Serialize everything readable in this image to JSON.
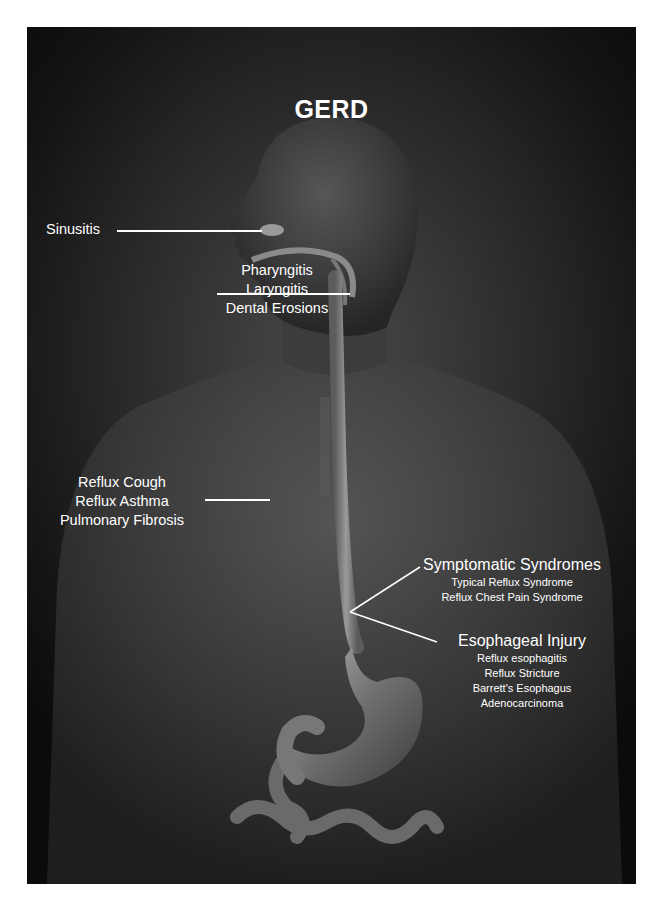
{
  "title": "GERD",
  "labels": {
    "sinusitis": {
      "text": "Sinusitis"
    },
    "throat": {
      "lines": [
        "Pharyngitis",
        "Laryngitis",
        "Dental Erosions"
      ]
    },
    "pulmonary": {
      "lines": [
        "Reflux Cough",
        "Reflux Asthma",
        "Pulmonary Fibrosis"
      ]
    },
    "symptomatic": {
      "heading": "Symptomatic Syndromes",
      "items": [
        "Typical Reflux Syndrome",
        "Reflux Chest Pain Syndrome"
      ]
    },
    "esophageal": {
      "heading": "Esophageal Injury",
      "items": [
        "Reflux esophagitis",
        "Reflux Stricture",
        "Barrett's Esophagus",
        "Adenocarcinoma"
      ]
    }
  },
  "colors": {
    "background_center": "#4a4a4a",
    "background_edge": "#0b0b0b",
    "text": "#ffffff",
    "esophagus": "#8a8a8a",
    "sinus_highlight": "#9a9a9a"
  }
}
